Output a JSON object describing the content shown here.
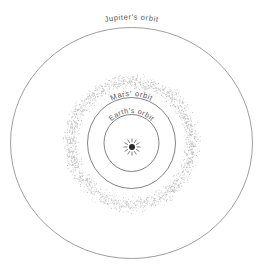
{
  "diagram": {
    "background_color": "#ffffff",
    "line_color": "#6d6d70",
    "label_color": "#55555a",
    "center": {
      "x": 131.5,
      "y": 143.0
    },
    "sun": {
      "name": "sun-symbol",
      "cx": 132,
      "cy": 147,
      "core_radius": 3.0,
      "ray_count": 12,
      "ray_inner": 4.6,
      "ray_outer": 8.6,
      "color": "#2b2b2e"
    },
    "orbits": [
      {
        "id": "jupiter",
        "label": "Jupiter's orbit",
        "rx": 121.0,
        "ry": 115.5,
        "label_placement": "outside-top",
        "label_radius_offset": 8.0
      },
      {
        "id": "mars",
        "label": "Mars' orbit",
        "rx": 44.0,
        "ry": 45.5,
        "label_placement": "on-arc-top",
        "label_radius_offset": 1.5
      },
      {
        "id": "earth",
        "label": "Earth's orbit",
        "rx": 27.5,
        "ry": 28.5,
        "label_placement": "on-arc-top",
        "label_radius_offset": 1.5
      }
    ],
    "asteroid_belt": {
      "name": "asteroid-belt",
      "inner_rx": 50.0,
      "inner_ry": 51.0,
      "outer_rx": 71.0,
      "outer_ry": 72.0,
      "dot_color": "#b9b9bd",
      "dot_count": 2100,
      "dot_radius": 0.42
    }
  },
  "chart_data": {
    "type": "scatter",
    "xlabel": "",
    "ylabel": "",
    "annotations": [
      "Jupiter's orbit",
      "Mars' orbit",
      "Earth's orbit"
    ],
    "series": [
      {
        "name": "Earth's orbit",
        "radius_px": 28
      },
      {
        "name": "Mars' orbit",
        "radius_px": 45
      },
      {
        "name": "Asteroid belt (inner)",
        "radius_px": 51
      },
      {
        "name": "Asteroid belt (outer)",
        "radius_px": 72
      },
      {
        "name": "Jupiter's orbit",
        "radius_px": 118
      }
    ]
  }
}
